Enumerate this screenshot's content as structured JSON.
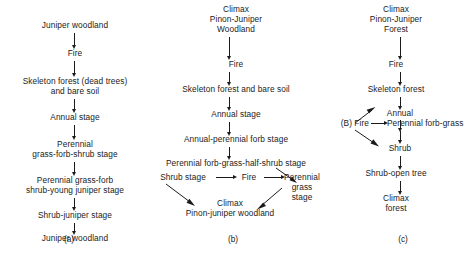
{
  "figure": {
    "background_color": "#ffffff",
    "text_color": "#1b1b1b",
    "type": "succession-flow-diagram",
    "panels": [
      {
        "id": "a",
        "label": "(a)",
        "nodes": [
          {
            "id": "a1",
            "text": "Juniper woodland"
          },
          {
            "id": "a2",
            "text": "Fire"
          },
          {
            "id": "a3",
            "line1": "Skeleton forest (dead trees)",
            "line2": "and bare soil"
          },
          {
            "id": "a4",
            "text": "Annual stage"
          },
          {
            "id": "a5",
            "line1": "Perennial",
            "line2": "grass-forb-shrub stage"
          },
          {
            "id": "a6",
            "line1": "Perennial grass-forb",
            "line2": "shrub-young juniper stage"
          },
          {
            "id": "a7",
            "text": "Shrub-juniper stage"
          },
          {
            "id": "a8",
            "text": "Juniper woodland"
          }
        ]
      },
      {
        "id": "b",
        "label": "(b)",
        "nodes": [
          {
            "id": "b1",
            "line1": "Climax",
            "line2": "Pinon-Juniper",
            "line3": "Woodland"
          },
          {
            "id": "b2",
            "text": "Fire"
          },
          {
            "id": "b3",
            "text": "Skeleton forest and bare soil"
          },
          {
            "id": "b4",
            "text": "Annual stage"
          },
          {
            "id": "b5",
            "text": "Annual-perennial forb stage"
          },
          {
            "id": "b6",
            "text": "Perennial forb-grass-half-shrub stage"
          },
          {
            "id": "b7",
            "text": "Shrub stage"
          },
          {
            "id": "b8",
            "text": "Fire"
          },
          {
            "id": "b9",
            "line1": "Perennial",
            "line2": "grass stage"
          },
          {
            "id": "b10",
            "line1": "Climax",
            "line2": "Pinon-juniper woodland"
          }
        ]
      },
      {
        "id": "c",
        "label": "(c)",
        "nodes": [
          {
            "id": "c1",
            "line1": "Climax",
            "line2": "Pinon-Juniper",
            "line3": "Forest"
          },
          {
            "id": "c2",
            "text": "Fire"
          },
          {
            "id": "c3",
            "text": "Skeleton forest"
          },
          {
            "id": "c4",
            "text": "Annual"
          },
          {
            "id": "c5",
            "text": "(B)  Fire"
          },
          {
            "id": "c6",
            "text": "Perennial forb-grass"
          },
          {
            "id": "c7",
            "text": "Shrub"
          },
          {
            "id": "c8",
            "text": "Shrub-open tree"
          },
          {
            "id": "c9",
            "line1": "Climax",
            "line2": "forest"
          }
        ]
      }
    ]
  }
}
